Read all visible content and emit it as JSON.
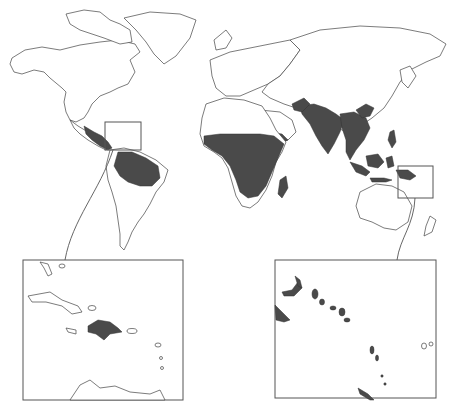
{
  "map": {
    "type": "world-choropleth",
    "background_color": "#ffffff",
    "outline_color": "#444444",
    "highlight_color": "#4a4a4a",
    "shaded_regions": [
      "Central America",
      "Northern South America (Amazon basin)",
      "Sub-Saharan Africa",
      "Madagascar",
      "Arabian Peninsula (south-west)",
      "Afghanistan / Pakistan",
      "India",
      "Southeast Asia",
      "Southern China",
      "Indonesia",
      "Papua New Guinea",
      "Solomon Islands",
      "Vanuatu",
      "Hispaniola"
    ],
    "insets": [
      {
        "name": "caribbean-inset",
        "region": "Caribbean",
        "shaded": [
          "Hispaniola"
        ]
      },
      {
        "name": "melanesia-inset",
        "region": "Solomon Islands / Vanuatu",
        "shaded": [
          "Papua New Guinea (east tip)",
          "Bougainville",
          "Solomon Islands",
          "Vanuatu"
        ]
      }
    ]
  }
}
